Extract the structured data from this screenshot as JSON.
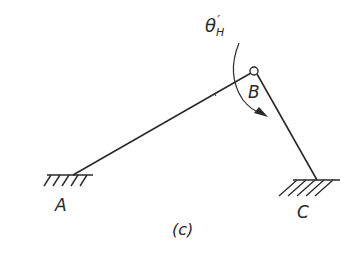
{
  "figure": {
    "caption": "(c)",
    "angle_label": {
      "symbol": "θ",
      "subscript": "H",
      "prime": "′"
    },
    "points": {
      "A": {
        "label": "A",
        "type": "fixed-support"
      },
      "B": {
        "label": "B",
        "type": "pin-joint"
      },
      "C": {
        "label": "C",
        "type": "fixed-support"
      }
    },
    "members": [
      {
        "from": "A",
        "to": "B"
      },
      {
        "from": "B",
        "to": "C"
      }
    ],
    "rotation_direction": "clockwise",
    "colors": {
      "line": "#2a2a2a",
      "background": "#ffffff"
    }
  }
}
